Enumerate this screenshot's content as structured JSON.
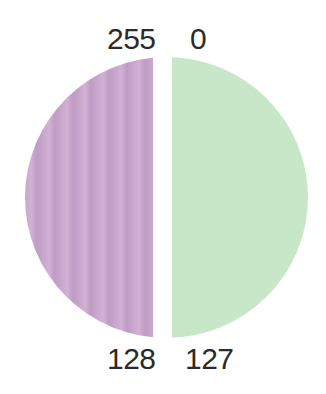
{
  "labels": {
    "top_left": "255",
    "top_right": "0",
    "bottom_left": "128",
    "bottom_right": "127"
  },
  "halves": {
    "left": {
      "color": "#c9a6cc",
      "description": "lilac striped half"
    },
    "right": {
      "color": "#c8e6c8",
      "description": "mint green half"
    }
  }
}
